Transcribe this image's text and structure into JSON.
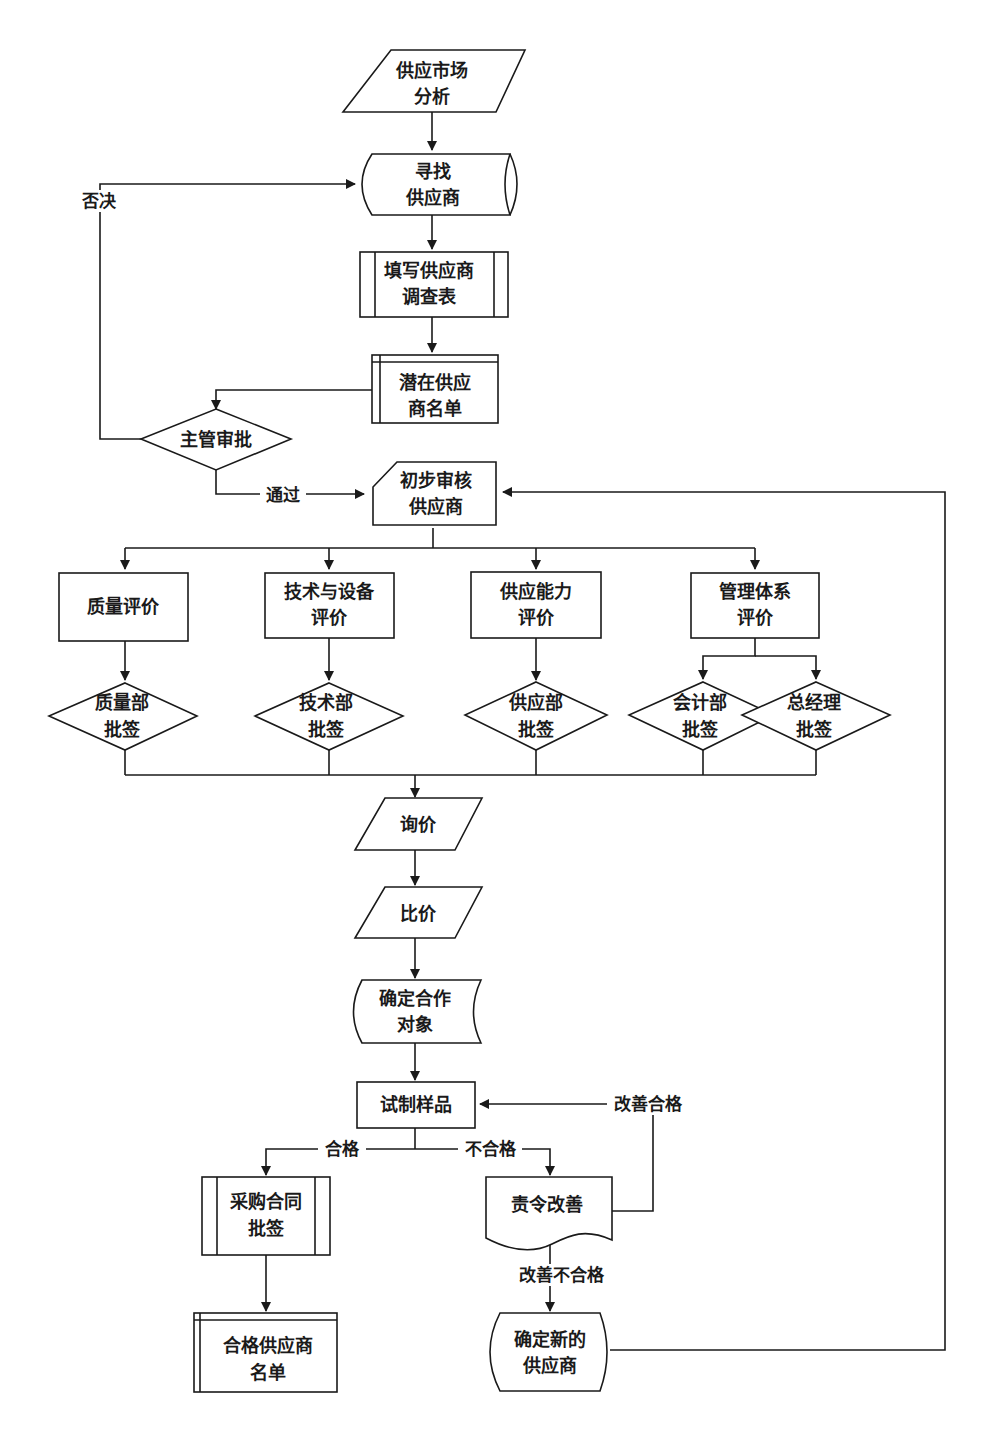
{
  "diagram": {
    "type": "flowchart",
    "nodes": {
      "market_analysis": {
        "shape": "parallelogram",
        "lines": [
          "供应市场",
          "分析"
        ]
      },
      "find_supplier": {
        "shape": "stored-data",
        "lines": [
          "寻找",
          "供应商"
        ]
      },
      "survey_form": {
        "shape": "predefined-process",
        "lines": [
          "填写供应商",
          "调查表"
        ]
      },
      "potential_list": {
        "shape": "internal-storage",
        "lines": [
          "潜在供应",
          "商名单"
        ]
      },
      "manager_approval": {
        "shape": "diamond",
        "lines": [
          "主管审批"
        ]
      },
      "preliminary_review": {
        "shape": "card",
        "lines": [
          "初步审核",
          "供应商"
        ]
      },
      "quality_eval": {
        "shape": "rectangle",
        "lines": [
          "质量评价"
        ]
      },
      "tech_eval": {
        "shape": "rectangle",
        "lines": [
          "技术与设备",
          "评价"
        ]
      },
      "supply_eval": {
        "shape": "rectangle",
        "lines": [
          "供应能力",
          "评价"
        ]
      },
      "mgmt_eval": {
        "shape": "rectangle",
        "lines": [
          "管理体系",
          "评价"
        ]
      },
      "quality_sign": {
        "shape": "diamond",
        "lines": [
          "质量部",
          "批签"
        ]
      },
      "tech_sign": {
        "shape": "diamond",
        "lines": [
          "技术部",
          "批签"
        ]
      },
      "supply_sign": {
        "shape": "diamond",
        "lines": [
          "供应部",
          "批签"
        ]
      },
      "accounting_sign": {
        "shape": "diamond",
        "lines": [
          "会计部",
          "批签"
        ]
      },
      "gm_sign": {
        "shape": "diamond",
        "lines": [
          "总经理",
          "批签"
        ]
      },
      "inquiry": {
        "shape": "parallelogram",
        "lines": [
          "询价"
        ]
      },
      "compare_price": {
        "shape": "parallelogram",
        "lines": [
          "比价"
        ]
      },
      "confirm_partner": {
        "shape": "stored-data",
        "lines": [
          "确定合作",
          "对象"
        ]
      },
      "trial_sample": {
        "shape": "rectangle",
        "lines": [
          "试制样品"
        ]
      },
      "contract_sign": {
        "shape": "predefined-process",
        "lines": [
          "采购合同",
          "批签"
        ]
      },
      "order_improve": {
        "shape": "document",
        "lines": [
          "责令改善"
        ]
      },
      "qualified_list": {
        "shape": "internal-storage",
        "lines": [
          "合格供应商",
          "名单"
        ]
      },
      "new_supplier": {
        "shape": "stored-data",
        "lines": [
          "确定新的",
          "供应商"
        ]
      }
    },
    "edge_labels": {
      "reject": "否决",
      "pass": "通过",
      "qualified": "合格",
      "unqualified": "不合格",
      "improve_ok": "改善合格",
      "improve_fail": "改善不合格"
    },
    "colors": {
      "stroke": "#1a1a1a",
      "fill": "#ffffff",
      "text": "#1a1a1a"
    }
  }
}
